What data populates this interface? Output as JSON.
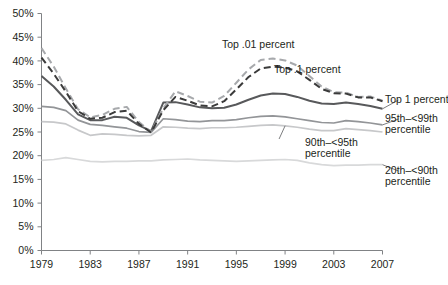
{
  "chart_data": {
    "type": "line",
    "title": "",
    "subtitle": "",
    "xlabel": "",
    "ylabel": "",
    "xlim": [
      1979,
      2007
    ],
    "ylim": [
      0,
      50
    ],
    "grid": false,
    "legend_position": "inline-right",
    "y_ticks": [
      "0%",
      "5%",
      "10%",
      "15%",
      "20%",
      "25%",
      "30%",
      "35%",
      "40%",
      "45%",
      "50%"
    ],
    "y_tick_values": [
      0,
      5,
      10,
      15,
      20,
      25,
      30,
      35,
      40,
      45,
      50
    ],
    "x_ticks": [
      "1979",
      "1983",
      "1987",
      "1991",
      "1995",
      "1999",
      "2003",
      "2007"
    ],
    "x_tick_values": [
      1979,
      1983,
      1987,
      1991,
      1995,
      1999,
      2003,
      2007
    ],
    "x": [
      1979,
      1980,
      1981,
      1982,
      1983,
      1984,
      1985,
      1986,
      1987,
      1988,
      1989,
      1990,
      1991,
      1992,
      1993,
      1994,
      1995,
      1996,
      1997,
      1998,
      1999,
      2000,
      2001,
      2002,
      2003,
      2004,
      2005,
      2006,
      2007
    ],
    "series": [
      {
        "name": "Top .01 percent",
        "label": "Top .01 percent",
        "color": "#a7a9ac",
        "style": "dashed",
        "width": 2.0,
        "values": [
          42.7,
          38.8,
          34.2,
          29.8,
          28.1,
          28.6,
          29.9,
          30.3,
          27.1,
          25.0,
          30.0,
          33.6,
          32.6,
          31.4,
          31.2,
          32.6,
          35.4,
          38.2,
          40.2,
          40.5,
          40.1,
          39.0,
          36.8,
          34.6,
          33.4,
          33.3,
          32.4,
          32.5,
          31.6
        ]
      },
      {
        "name": "Top .1 percent",
        "label": "Top .1 percent",
        "color": "#3b3b3b",
        "style": "dashed",
        "width": 2.0,
        "values": [
          40.7,
          37.3,
          33.5,
          29.4,
          27.8,
          28.0,
          29.2,
          29.5,
          26.7,
          24.9,
          29.6,
          32.4,
          31.6,
          30.6,
          30.4,
          31.5,
          34.0,
          36.6,
          38.4,
          38.8,
          38.6,
          37.8,
          36.0,
          34.1,
          33.2,
          33.1,
          32.3,
          32.3,
          31.5
        ]
      },
      {
        "name": "Top 1 percent",
        "label": "Top 1 percent",
        "color": "#58595b",
        "style": "solid",
        "width": 2.0,
        "values": [
          36.8,
          34.6,
          31.8,
          28.7,
          27.5,
          27.5,
          28.2,
          28.0,
          26.4,
          25.2,
          31.2,
          31.3,
          30.8,
          30.2,
          30.0,
          30.1,
          30.8,
          31.8,
          32.7,
          33.1,
          33.0,
          32.4,
          31.6,
          31.0,
          30.9,
          31.2,
          30.9,
          30.5,
          29.9
        ]
      },
      {
        "name": "95th–<99th percentile",
        "label": "95th–<99th percentile",
        "color": "#939598",
        "style": "solid",
        "width": 1.7,
        "values": [
          30.4,
          30.2,
          29.5,
          27.5,
          26.6,
          26.4,
          26.1,
          25.8,
          25.1,
          24.9,
          27.8,
          27.6,
          27.3,
          27.2,
          27.4,
          27.4,
          27.6,
          28.0,
          28.3,
          28.4,
          28.2,
          27.8,
          27.4,
          27.0,
          26.9,
          27.4,
          27.2,
          26.9,
          26.5
        ]
      },
      {
        "name": "90th–<95th percentile",
        "label": "90th–<95th percentile",
        "color": "#c7c8ca",
        "style": "solid",
        "width": 1.7,
        "values": [
          27.2,
          27.1,
          26.7,
          25.4,
          24.3,
          24.6,
          24.5,
          24.3,
          24.2,
          24.3,
          26.1,
          26.0,
          25.8,
          25.7,
          25.9,
          25.9,
          26.0,
          26.2,
          26.4,
          26.5,
          26.3,
          26.0,
          25.6,
          25.3,
          25.3,
          25.7,
          25.5,
          25.3,
          25.0
        ]
      },
      {
        "name": "20th–<90th percentile",
        "label": "20th–<90th percentile",
        "color": "#d8d9da",
        "style": "solid",
        "width": 1.7,
        "values": [
          19.0,
          19.2,
          19.6,
          19.2,
          18.8,
          18.7,
          18.8,
          18.8,
          18.9,
          18.9,
          19.1,
          19.2,
          19.3,
          19.1,
          19.0,
          18.9,
          18.8,
          18.9,
          19.0,
          19.1,
          19.2,
          19.0,
          18.5,
          18.1,
          17.9,
          18.0,
          18.0,
          18.1,
          18.1
        ]
      }
    ],
    "annotations": [
      {
        "text": "Top .01 percent",
        "x": 222,
        "y": 48
      },
      {
        "text": "Top .1 percent",
        "x": 274,
        "y": 73
      },
      {
        "text": "Top 1 percent",
        "x": 385,
        "y": 103
      },
      {
        "text": "95th–<99th",
        "x": 385,
        "y": 122
      },
      {
        "text": "percentile",
        "x": 385,
        "y": 133
      },
      {
        "text": "90th–<95th",
        "x": 305,
        "y": 146
      },
      {
        "text": "percentile",
        "x": 305,
        "y": 157
      },
      {
        "text": "20th–<90th",
        "x": 385,
        "y": 174
      },
      {
        "text": "percentile",
        "x": 385,
        "y": 185
      }
    ]
  }
}
